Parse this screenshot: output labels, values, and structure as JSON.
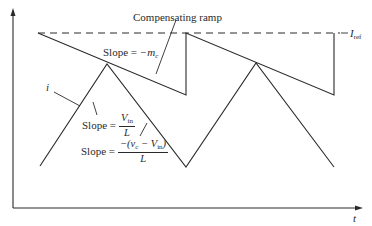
{
  "figure": {
    "type": "peak current-mode control waveform with slope compensation",
    "colors": {
      "line": "#2a2a2a",
      "background": "#ffffff"
    },
    "axes": {
      "x_label": "t",
      "y_label": ""
    },
    "labels": {
      "compensating_ramp": "Compensating ramp",
      "i_ref": "I",
      "i_ref_sub": "ref",
      "current": "i",
      "slope_ramp_prefix": "Slope = ",
      "slope_ramp_value": "−m",
      "slope_ramp_sub": "c",
      "slope_up_prefix": "Slope = ",
      "slope_up_num": "V",
      "slope_up_num_sub": "in",
      "slope_up_den": "L",
      "slope_down_prefix": "Slope = ",
      "slope_down_num_a": "−(v",
      "slope_down_num_a_sub": "c",
      "slope_down_num_b": " − V",
      "slope_down_num_b_sub": "in",
      "slope_down_num_c": ")",
      "slope_down_den": "L"
    },
    "geometry": {
      "y_axis": {
        "x": 13,
        "y_top": 10,
        "y_bottom": 208
      },
      "x_axis": {
        "y": 208,
        "x_left": 13,
        "x_right": 360
      },
      "iref_dashed_y": 33,
      "ramp_segments": [
        {
          "x1": 38,
          "y1": 33,
          "x2": 186,
          "y2": 95
        },
        {
          "x1": 186,
          "y1": 95,
          "x2": 186,
          "y2": 33
        },
        {
          "x1": 186,
          "y1": 33,
          "x2": 334,
          "y2": 95
        },
        {
          "x1": 334,
          "y1": 95,
          "x2": 334,
          "y2": 33
        }
      ],
      "current_waveform": [
        [
          40,
          166
        ],
        [
          107,
          64
        ],
        [
          186,
          167
        ],
        [
          256,
          63
        ],
        [
          334,
          167
        ]
      ]
    }
  }
}
